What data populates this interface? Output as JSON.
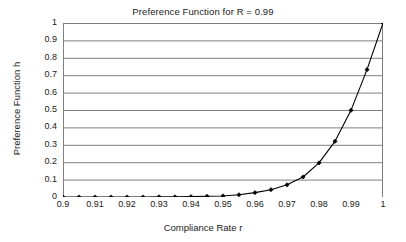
{
  "chart_data": {
    "type": "line",
    "title": "Preference Function for R = 0.99",
    "xlabel": "Compliance Rate r",
    "ylabel": "Preference Function h",
    "xlim": [
      0.9,
      1.0
    ],
    "ylim": [
      0,
      1
    ],
    "grid": "horizontal",
    "legend": "none",
    "marker": "filled-diamond",
    "line_color": "#000000",
    "grid_color": "#808080",
    "axis_color": "#808080",
    "x_ticks": [
      "0.9",
      "0.91",
      "0.92",
      "0.93",
      "0.94",
      "0.95",
      "0.96",
      "0.97",
      "0.98",
      "0.99",
      "1"
    ],
    "x_tick_values": [
      0.9,
      0.91,
      0.92,
      0.93,
      0.94,
      0.95,
      0.96,
      0.97,
      0.98,
      0.99,
      1.0
    ],
    "y_ticks": [
      "0",
      "0.1",
      "0.2",
      "0.3",
      "0.4",
      "0.5",
      "0.6",
      "0.7",
      "0.8",
      "0.9",
      "1"
    ],
    "y_tick_values": [
      0,
      0.1,
      0.2,
      0.3,
      0.4,
      0.5,
      0.6,
      0.7,
      0.8,
      0.9,
      1.0
    ],
    "x": [
      0.9,
      0.905,
      0.91,
      0.915,
      0.92,
      0.925,
      0.93,
      0.935,
      0.94,
      0.945,
      0.95,
      0.955,
      0.96,
      0.965,
      0.97,
      0.975,
      0.98,
      0.985,
      0.99,
      0.995,
      1.0
    ],
    "values": [
      0.0,
      0.0,
      0.0,
      0.0,
      0.0,
      0.0,
      0.001,
      0.001,
      0.002,
      0.004,
      0.006,
      0.013,
      0.025,
      0.042,
      0.07,
      0.115,
      0.196,
      0.32,
      0.498,
      0.732,
      1.0
    ],
    "series": [
      {
        "name": "h",
        "values": [
          0.0,
          0.0,
          0.0,
          0.0,
          0.0,
          0.0,
          0.001,
          0.001,
          0.002,
          0.004,
          0.006,
          0.013,
          0.025,
          0.042,
          0.07,
          0.115,
          0.196,
          0.32,
          0.498,
          0.732,
          1.0
        ]
      }
    ]
  }
}
